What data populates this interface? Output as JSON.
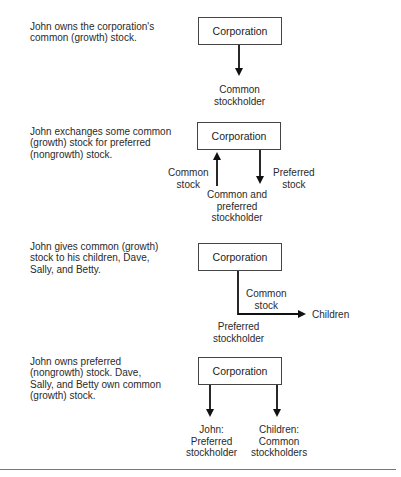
{
  "scenarios": [
    {
      "description": [
        "John owns the corporation's",
        "common (growth) stock."
      ],
      "box": "Corporation",
      "labels": {
        "bottom": [
          "Common",
          "stockholder"
        ]
      }
    },
    {
      "description": [
        "John exchanges some common",
        "(growth) stock for preferred",
        "(nongrowth) stock."
      ],
      "box": "Corporation",
      "labels": {
        "left": [
          "Common",
          "stock"
        ],
        "right": [
          "Preferred",
          "stock"
        ],
        "bottom": [
          "Common and",
          "preferred",
          "stockholder"
        ]
      }
    },
    {
      "description": [
        "John gives common (growth)",
        "stock to his children, Dave,",
        "Sally, and Betty."
      ],
      "box": "Corporation",
      "labels": {
        "arrow": [
          "Common",
          "stock"
        ],
        "target": "Children",
        "bottom": [
          "Preferred",
          "stockholder"
        ]
      }
    },
    {
      "description": [
        "John owns preferred",
        "(nongrowth) stock. Dave,",
        "Sally, and Betty own common",
        "(growth) stock."
      ],
      "box": "Corporation",
      "labels": {
        "left": [
          "John:",
          "Preferred",
          "stockholder"
        ],
        "right": [
          "Children:",
          "Common",
          "stockholders"
        ]
      }
    }
  ]
}
